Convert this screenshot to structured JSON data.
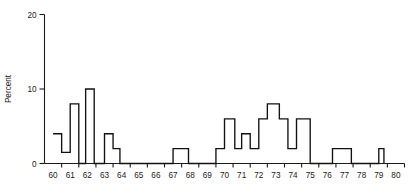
{
  "chart_data": {
    "type": "bar",
    "title": "",
    "subtitle": "",
    "xlabel": "",
    "ylabel": "Percent",
    "grid": false,
    "legend": null,
    "xlim": [
      59.5,
      80.5
    ],
    "ylim": [
      0,
      20
    ],
    "y_ticks": [
      0,
      10,
      20
    ],
    "y_tick_labels": [
      "0",
      "10",
      "20"
    ],
    "x_ticks": [
      60,
      61,
      62,
      63,
      64,
      65,
      66,
      67,
      68,
      69,
      70,
      71,
      72,
      73,
      74,
      75,
      76,
      77,
      78,
      79,
      80
    ],
    "x_tick_labels": [
      "60",
      "61",
      "62",
      "63",
      "64",
      "65",
      "66",
      "67",
      "68",
      "69",
      "70",
      "71",
      "72",
      "73",
      "74",
      "75",
      "76",
      "77",
      "78",
      "79",
      "80"
    ],
    "bin_width": 0.5,
    "categories": [
      "59.75",
      "60.25",
      "60.75",
      "61.25",
      "61.75",
      "62.25",
      "62.75",
      "63.25",
      "63.75",
      "64.25",
      "64.75",
      "65.25",
      "65.75",
      "66.25",
      "66.75",
      "67.25",
      "67.75",
      "68.25",
      "68.75",
      "69.25",
      "69.75",
      "70.25",
      "70.75",
      "71.25",
      "71.75",
      "72.25",
      "72.75",
      "73.25",
      "73.75",
      "74.25",
      "74.75",
      "75.25",
      "75.75",
      "76.25",
      "76.75",
      "77.25",
      "77.75",
      "78.25",
      "78.75",
      "79.25",
      "79.75"
    ],
    "values": [
      0,
      4,
      4,
      1.5,
      8,
      8,
      10,
      10,
      4,
      2,
      0,
      0,
      0,
      0,
      0,
      0,
      2,
      2,
      0,
      0,
      2,
      2,
      6,
      6,
      4,
      4,
      6,
      8,
      8,
      6,
      2,
      6,
      6,
      0,
      2,
      2,
      0,
      0,
      0,
      2,
      0
    ],
    "step_outline": [
      {
        "x": 60.0,
        "y": 4
      },
      {
        "x": 60.5,
        "y": 4
      },
      {
        "x": 60.5,
        "y": 1.5
      },
      {
        "x": 61.0,
        "y": 1.5
      },
      {
        "x": 61.0,
        "y": 8
      },
      {
        "x": 61.5,
        "y": 8
      },
      {
        "x": 61.5,
        "y": 0
      },
      {
        "x": 61.9,
        "y": 0
      },
      {
        "x": 61.9,
        "y": 10
      },
      {
        "x": 62.4,
        "y": 10
      },
      {
        "x": 62.4,
        "y": 0
      },
      {
        "x": 63.0,
        "y": 0
      },
      {
        "x": 63.0,
        "y": 4
      },
      {
        "x": 63.5,
        "y": 4
      },
      {
        "x": 63.5,
        "y": 2
      },
      {
        "x": 63.9,
        "y": 2
      },
      {
        "x": 63.9,
        "y": 0
      },
      {
        "x": 67.0,
        "y": 0
      },
      {
        "x": 67.0,
        "y": 2
      },
      {
        "x": 67.9,
        "y": 2
      },
      {
        "x": 67.9,
        "y": 0
      },
      {
        "x": 69.5,
        "y": 0
      },
      {
        "x": 69.5,
        "y": 2
      },
      {
        "x": 70.0,
        "y": 2
      },
      {
        "x": 70.0,
        "y": 6
      },
      {
        "x": 70.6,
        "y": 6
      },
      {
        "x": 70.6,
        "y": 2
      },
      {
        "x": 71.0,
        "y": 2
      },
      {
        "x": 71.0,
        "y": 4
      },
      {
        "x": 71.5,
        "y": 4
      },
      {
        "x": 71.5,
        "y": 2
      },
      {
        "x": 72.0,
        "y": 2
      },
      {
        "x": 72.0,
        "y": 6
      },
      {
        "x": 72.5,
        "y": 6
      },
      {
        "x": 72.5,
        "y": 8
      },
      {
        "x": 73.2,
        "y": 8
      },
      {
        "x": 73.2,
        "y": 6
      },
      {
        "x": 73.7,
        "y": 6
      },
      {
        "x": 73.7,
        "y": 2
      },
      {
        "x": 74.2,
        "y": 2
      },
      {
        "x": 74.2,
        "y": 6
      },
      {
        "x": 75.0,
        "y": 6
      },
      {
        "x": 75.0,
        "y": 0
      },
      {
        "x": 76.3,
        "y": 0
      },
      {
        "x": 76.3,
        "y": 2
      },
      {
        "x": 77.4,
        "y": 2
      },
      {
        "x": 77.4,
        "y": 0
      },
      {
        "x": 79.0,
        "y": 0
      },
      {
        "x": 79.0,
        "y": 2
      },
      {
        "x": 79.3,
        "y": 2
      },
      {
        "x": 79.3,
        "y": 0
      }
    ],
    "notable_points": {
      "peak_value": 10,
      "peak_x": "62",
      "second_peak_value": 8,
      "second_peak_x": "73"
    }
  }
}
